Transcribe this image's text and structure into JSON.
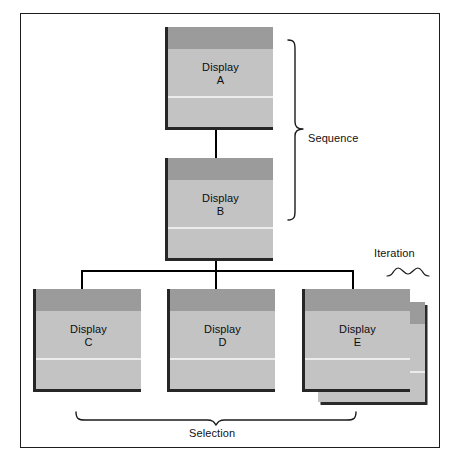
{
  "diagram": {
    "background_color": "#ffffff",
    "frame_color": "#1c1c1c",
    "card_header_color": "#9b9b9b",
    "card_body_color": "#c3c3c3",
    "card_shadow_color": "#262626",
    "connector_color": "#000000",
    "text_color": "#111111"
  },
  "nodes": [
    {
      "id": "a",
      "line1": "Display",
      "line2": "A",
      "stacked": false
    },
    {
      "id": "b",
      "line1": "Display",
      "line2": "B",
      "stacked": false
    },
    {
      "id": "c",
      "line1": "Display",
      "line2": "C",
      "stacked": false
    },
    {
      "id": "d",
      "line1": "Display",
      "line2": "D",
      "stacked": false
    },
    {
      "id": "e",
      "line1": "Display",
      "line2": "E",
      "stacked": true
    }
  ],
  "annotations": {
    "sequence": "Sequence",
    "iteration": "Iteration",
    "selection": "Selection"
  }
}
